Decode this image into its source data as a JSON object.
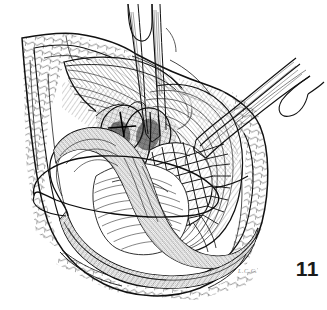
{
  "figure": {
    "number_label": "11",
    "signature_label": "L.C.C.",
    "caption": "",
    "background_color": "#ffffff",
    "ink_color": "#1a1a1a",
    "medium": "pen-and-ink line drawing"
  },
  "scene": {
    "title": "Surgical operative field",
    "elements": [
      {
        "name": "wound-margin",
        "label": "Retracted incision margin",
        "description": "Diamond-shaped open wound outline with everted skin and subcutaneous fat edges"
      },
      {
        "name": "subcutaneous-fat",
        "label": "Subcutaneous fat layer",
        "description": "Cobblestone lobular hatching along the left, right and lower wound edges"
      },
      {
        "name": "fascia-flap-upper-left",
        "label": "Retracted fascial flap",
        "description": "Fan of parallel strokes folded back over the upper-left wound edge"
      },
      {
        "name": "muscle-wall-right",
        "label": "Retracted muscle wall",
        "description": "Long sweeping parallel fibers forming the right interior wall of the exposure"
      },
      {
        "name": "aorta-vessel",
        "label": "Great vessel",
        "description": "Heavily stippled tubular structure crossing the field from left to lower right"
      },
      {
        "name": "vascular-bifurcation",
        "label": "Vessel bifurcation and branches",
        "description": "Dense cross-hatched branching vessels in the center of the field"
      },
      {
        "name": "graft-anastomosis",
        "label": "Graft with running suture line",
        "description": "Cross-hatched lattice of suture strands across the right-central graft body"
      },
      {
        "name": "suture-loop",
        "label": "Suture loop",
        "description": "Large open elliptical suture loop extending out over the left wound margin"
      },
      {
        "name": "forceps-upper-center",
        "label": "Forceps, upper center",
        "description": "Fine-tipped instrument entering vertically from the top of the frame"
      },
      {
        "name": "forceps-upper-right",
        "label": "Forceps, upper right",
        "description": "Second fine-tipped instrument entering obliquely from the upper right"
      }
    ]
  }
}
